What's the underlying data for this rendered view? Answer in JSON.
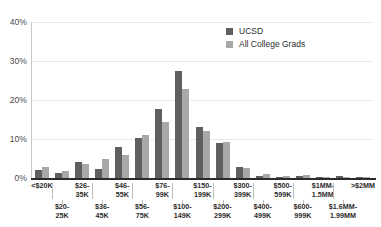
{
  "chart_data": {
    "type": "bar",
    "title": "",
    "subtitle": "",
    "xlabel": "",
    "ylabel": "",
    "ylim": [
      0,
      40
    ],
    "yticks": [
      "0%",
      "10%",
      "20%",
      "30%",
      "40%"
    ],
    "ytick_values": [
      0,
      10,
      20,
      30,
      40
    ],
    "grid": true,
    "legend_position": "top-right",
    "categories": [
      "<$20K",
      "$20-25K",
      "$26-35K",
      "$36-45K",
      "$46-55K",
      "$56-75K",
      "$76-99K",
      "$100-149K",
      "$150-199K",
      "$200-299K",
      "$300-399K",
      "$400-499K",
      "$500-599K",
      "$600-999K",
      "$1MM-1.5MM",
      "$1.6MM-1.99MM",
      ">$2MM"
    ],
    "category_lines": [
      [
        "<$20K"
      ],
      [
        "$20-",
        "25K"
      ],
      [
        "$26-",
        "35K"
      ],
      [
        "$36-",
        "45K"
      ],
      [
        "$46-",
        "55K"
      ],
      [
        "$56-",
        "75K"
      ],
      [
        "$76-",
        "99K"
      ],
      [
        "$100-",
        "149K"
      ],
      [
        "$150-",
        "199K"
      ],
      [
        "$200-",
        "299K"
      ],
      [
        "$300-",
        "399K"
      ],
      [
        "$400-",
        "499K"
      ],
      [
        "$500-",
        "599K"
      ],
      [
        "$600-",
        "999K"
      ],
      [
        "$1MM-",
        "1.5MM"
      ],
      [
        "$1.6MM-",
        "1.99MM"
      ],
      [
        ">$2MM"
      ]
    ],
    "series": [
      {
        "name": "UCSD",
        "color": "#5f5f5f",
        "values": [
          2.1,
          1.3,
          4.0,
          2.2,
          8.0,
          10.2,
          17.7,
          27.4,
          13.0,
          8.9,
          2.8,
          0.6,
          0.3,
          0.5,
          0.2,
          0.5,
          0.1
        ]
      },
      {
        "name": "All College Grads",
        "color": "#a8a8a8",
        "values": [
          2.9,
          1.8,
          3.5,
          4.9,
          5.9,
          11.0,
          14.4,
          22.8,
          12.1,
          9.2,
          2.6,
          1.1,
          0.6,
          0.7,
          0.2,
          0.2,
          0.2
        ]
      }
    ]
  },
  "legend": {
    "entries": [
      {
        "label": "UCSD",
        "color": "#5f5f5f"
      },
      {
        "label": "All College Grads",
        "color": "#a8a8a8"
      }
    ]
  },
  "axis": {
    "y": {
      "ticks": [
        {
          "label": "40%",
          "value": 40
        },
        {
          "label": "30%",
          "value": 30
        },
        {
          "label": "20%",
          "value": 20
        },
        {
          "label": "10%",
          "value": 10
        },
        {
          "label": "0%",
          "value": 0
        }
      ]
    }
  },
  "colors": {
    "series_ucsd": "#5f5f5f",
    "series_all_grads": "#a8a8a8",
    "gridline": "#e8e8e8",
    "axis": "#2b2b2b",
    "background": "#ffffff",
    "text": "#2b2b2b"
  }
}
